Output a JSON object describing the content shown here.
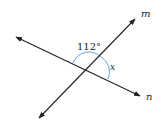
{
  "diagram": {
    "lines": [
      {
        "name": "m",
        "label": "m"
      },
      {
        "name": "n",
        "label": "n"
      }
    ],
    "angles": {
      "given": "112°",
      "unknown": "x"
    },
    "colors": {
      "line": "#222222",
      "arc": "#6aa6cf"
    }
  }
}
